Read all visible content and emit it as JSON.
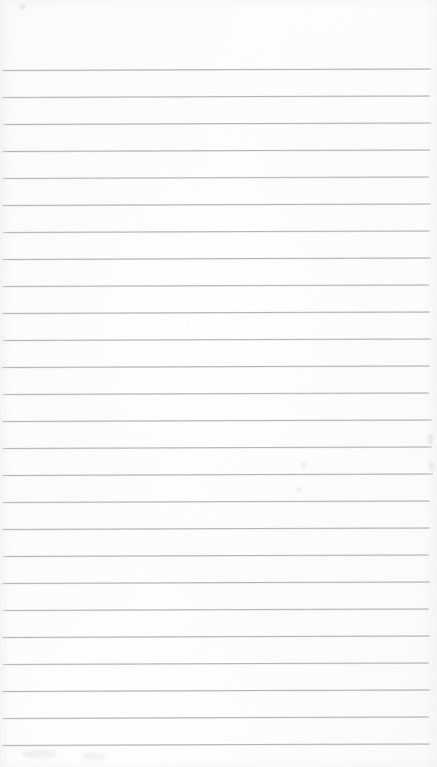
{
  "document": {
    "kind": "scanned-ruled-paper",
    "title": "Blank ruled notebook page",
    "content_text": "",
    "handwriting": "none",
    "printed_text": "none",
    "page_width": 437,
    "page_height": 767
  },
  "paper": {
    "background_color": "#fdfdfd",
    "edge_tone_color": "#f7f7f7",
    "rule_color": "#b2b2b2",
    "rule_thickness_px": 1,
    "margin_rule": "none",
    "top_margin_px": 70,
    "bottom_margin_px": 22,
    "line_spacing_px": 27,
    "line_count": 26,
    "skew_px_over_width": -1.6
  },
  "rules": [
    {
      "index": 1,
      "y": 70,
      "x_start": 2,
      "x_end": 431,
      "opacity": 0.95
    },
    {
      "index": 2,
      "y": 97,
      "x_start": 2,
      "x_end": 430,
      "opacity": 0.92
    },
    {
      "index": 3,
      "y": 124,
      "x_start": 3,
      "x_end": 431,
      "opacity": 0.93
    },
    {
      "index": 4,
      "y": 151,
      "x_start": 2,
      "x_end": 430,
      "opacity": 0.94
    },
    {
      "index": 5,
      "y": 178,
      "x_start": 3,
      "x_end": 429,
      "opacity": 0.9
    },
    {
      "index": 6,
      "y": 205,
      "x_start": 2,
      "x_end": 431,
      "opacity": 0.93
    },
    {
      "index": 7,
      "y": 232,
      "x_start": 3,
      "x_end": 430,
      "opacity": 0.92
    },
    {
      "index": 8,
      "y": 259,
      "x_start": 2,
      "x_end": 431,
      "opacity": 0.94
    },
    {
      "index": 9,
      "y": 286,
      "x_start": 3,
      "x_end": 429,
      "opacity": 0.91
    },
    {
      "index": 10,
      "y": 313,
      "x_start": 2,
      "x_end": 430,
      "opacity": 0.93
    },
    {
      "index": 11,
      "y": 340,
      "x_start": 3,
      "x_end": 431,
      "opacity": 0.92
    },
    {
      "index": 12,
      "y": 367,
      "x_start": 2,
      "x_end": 430,
      "opacity": 0.94
    },
    {
      "index": 13,
      "y": 394,
      "x_start": 3,
      "x_end": 429,
      "opacity": 0.92
    },
    {
      "index": 14,
      "y": 421,
      "x_start": 2,
      "x_end": 432,
      "opacity": 0.93
    },
    {
      "index": 15,
      "y": 448,
      "x_start": 3,
      "x_end": 432,
      "opacity": 0.92
    },
    {
      "index": 16,
      "y": 475,
      "x_start": 2,
      "x_end": 433,
      "opacity": 0.93
    },
    {
      "index": 17,
      "y": 502,
      "x_start": 3,
      "x_end": 430,
      "opacity": 0.91
    },
    {
      "index": 18,
      "y": 529,
      "x_start": 2,
      "x_end": 430,
      "opacity": 0.93
    },
    {
      "index": 19,
      "y": 556,
      "x_start": 3,
      "x_end": 429,
      "opacity": 0.92
    },
    {
      "index": 20,
      "y": 583,
      "x_start": 2,
      "x_end": 430,
      "opacity": 0.93
    },
    {
      "index": 21,
      "y": 610,
      "x_start": 3,
      "x_end": 429,
      "opacity": 0.92
    },
    {
      "index": 22,
      "y": 637,
      "x_start": 2,
      "x_end": 430,
      "opacity": 0.93
    },
    {
      "index": 23,
      "y": 664,
      "x_start": 3,
      "x_end": 429,
      "opacity": 0.92
    },
    {
      "index": 24,
      "y": 691,
      "x_start": 2,
      "x_end": 430,
      "opacity": 0.94
    },
    {
      "index": 25,
      "y": 718,
      "x_start": 3,
      "x_end": 429,
      "opacity": 0.92
    },
    {
      "index": 26,
      "y": 745,
      "x_start": 2,
      "x_end": 430,
      "opacity": 0.93
    }
  ],
  "artifacts": [
    {
      "name": "speck-top-left",
      "x": 19,
      "y": 4,
      "w": 7,
      "h": 5
    },
    {
      "name": "speck-bottom-left",
      "x": 22,
      "y": 750,
      "w": 34,
      "h": 8
    },
    {
      "name": "speck-bottom-mid",
      "x": 82,
      "y": 753,
      "w": 24,
      "h": 7
    },
    {
      "name": "speck-right-edge-a",
      "x": 428,
      "y": 434,
      "w": 5,
      "h": 10
    },
    {
      "name": "speck-right-edge-b",
      "x": 429,
      "y": 462,
      "w": 5,
      "h": 9
    },
    {
      "name": "speck-mid-a",
      "x": 301,
      "y": 462,
      "w": 5,
      "h": 6
    },
    {
      "name": "speck-mid-b",
      "x": 296,
      "y": 487,
      "w": 6,
      "h": 5
    }
  ]
}
